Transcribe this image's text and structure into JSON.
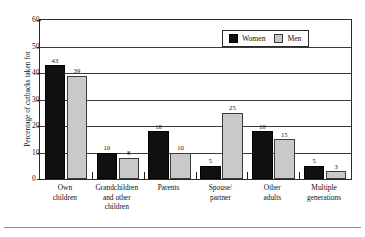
{
  "chart_data": {
    "type": "bar",
    "title": "",
    "xlabel": "",
    "ylabel": "Percentage of cutbacks taken for",
    "ylim": [
      0,
      60
    ],
    "yticks": [
      0,
      10,
      20,
      30,
      40,
      50,
      60
    ],
    "grid": true,
    "legend_position": "top-right",
    "categories": [
      "Own\nchildren",
      "Grandchildren\nand other\nchildren",
      "Parents",
      "Spouse/\npartner",
      "Other\nadults",
      "Multiple\ngenerations"
    ],
    "series": [
      {
        "name": "Women",
        "color": "#101010",
        "values": [
          43,
          10,
          18,
          5,
          18,
          5
        ]
      },
      {
        "name": "Men",
        "color": "#c9c9c9",
        "values": [
          39,
          8,
          10,
          25,
          15,
          3
        ]
      }
    ]
  },
  "legend": {
    "items": [
      {
        "label": "Women",
        "swatch": "women"
      },
      {
        "label": "Men",
        "swatch": "men"
      }
    ]
  },
  "axis": {
    "y_title": "Percentage of cutbacks taken for",
    "tick_labels": [
      "0",
      "10",
      "20",
      "30",
      "40",
      "50",
      "60"
    ]
  }
}
